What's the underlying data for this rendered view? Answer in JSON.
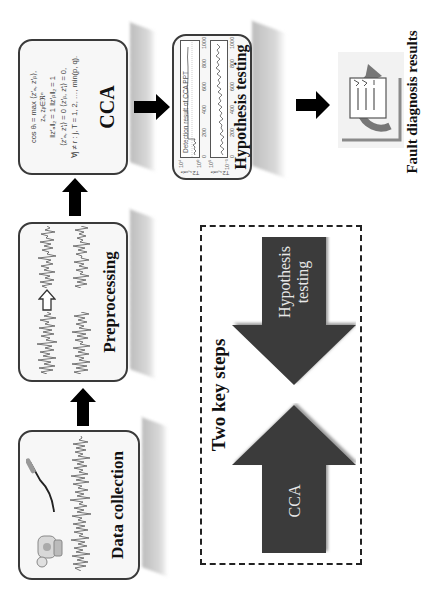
{
  "figure": {
    "orientation": "rotated 90 degrees counter-clockwise",
    "steps": [
      {
        "id": "data-collection",
        "label": "Data collection"
      },
      {
        "id": "preprocessing",
        "label": "Preprocessing"
      },
      {
        "id": "cca",
        "label": "CCA"
      },
      {
        "id": "hypothesis-testing",
        "label": "Hypothesis testing"
      },
      {
        "id": "fault-diagnosis",
        "label": "Fault diagnosis results"
      }
    ],
    "cca_formula": {
      "line1": "cos θᵢ = max  ⟨z′ₐ, z′ᵦ⟩,",
      "line2": "zₐ, zᵦ∈ℜⁿ",
      "line3": "‖z′ₐ‖₂ = 1    ‖z′ᵦ‖₂ = 1",
      "line4": "⟨z′ₐ, z′ⱼ⟩ = 0    ⟨z′ᵦ, z′ⱼ⟩ = 0,",
      "line5": "∀j ≠ r :   j, T = 1, 2, …, min(p, q)."
    },
    "hypothesis_plots": {
      "title": "Detection result of CCA PPT",
      "top": {
        "ylabel": "T2ₛ꜀ₒₐₗₑ",
        "yticks": [
          "10⁴",
          "10²",
          "10⁰"
        ],
        "xticks": [
          "0",
          "200",
          "400",
          "600",
          "800",
          "1000"
        ]
      },
      "bottom": {
        "ylabel": "T2ₛ꜀ₒₐₗₑ",
        "yticks": [
          "10⁵",
          "10²",
          "10⁻¹"
        ],
        "xticks": [
          "0",
          "200",
          "400",
          "600",
          "800",
          "1000"
        ]
      }
    },
    "key_steps": {
      "title": "Two key steps",
      "arrow_up_label": "CCA",
      "arrow_down_label_line1": "Hypothesis",
      "arrow_down_label_line2": "testing"
    },
    "colors": {
      "box_border": "#3a3a3a",
      "box_fill": "#f7f7f7",
      "arrow": "#000000",
      "key_arrow": "#3b3b3b",
      "shadow": "#c4c4c4"
    }
  }
}
